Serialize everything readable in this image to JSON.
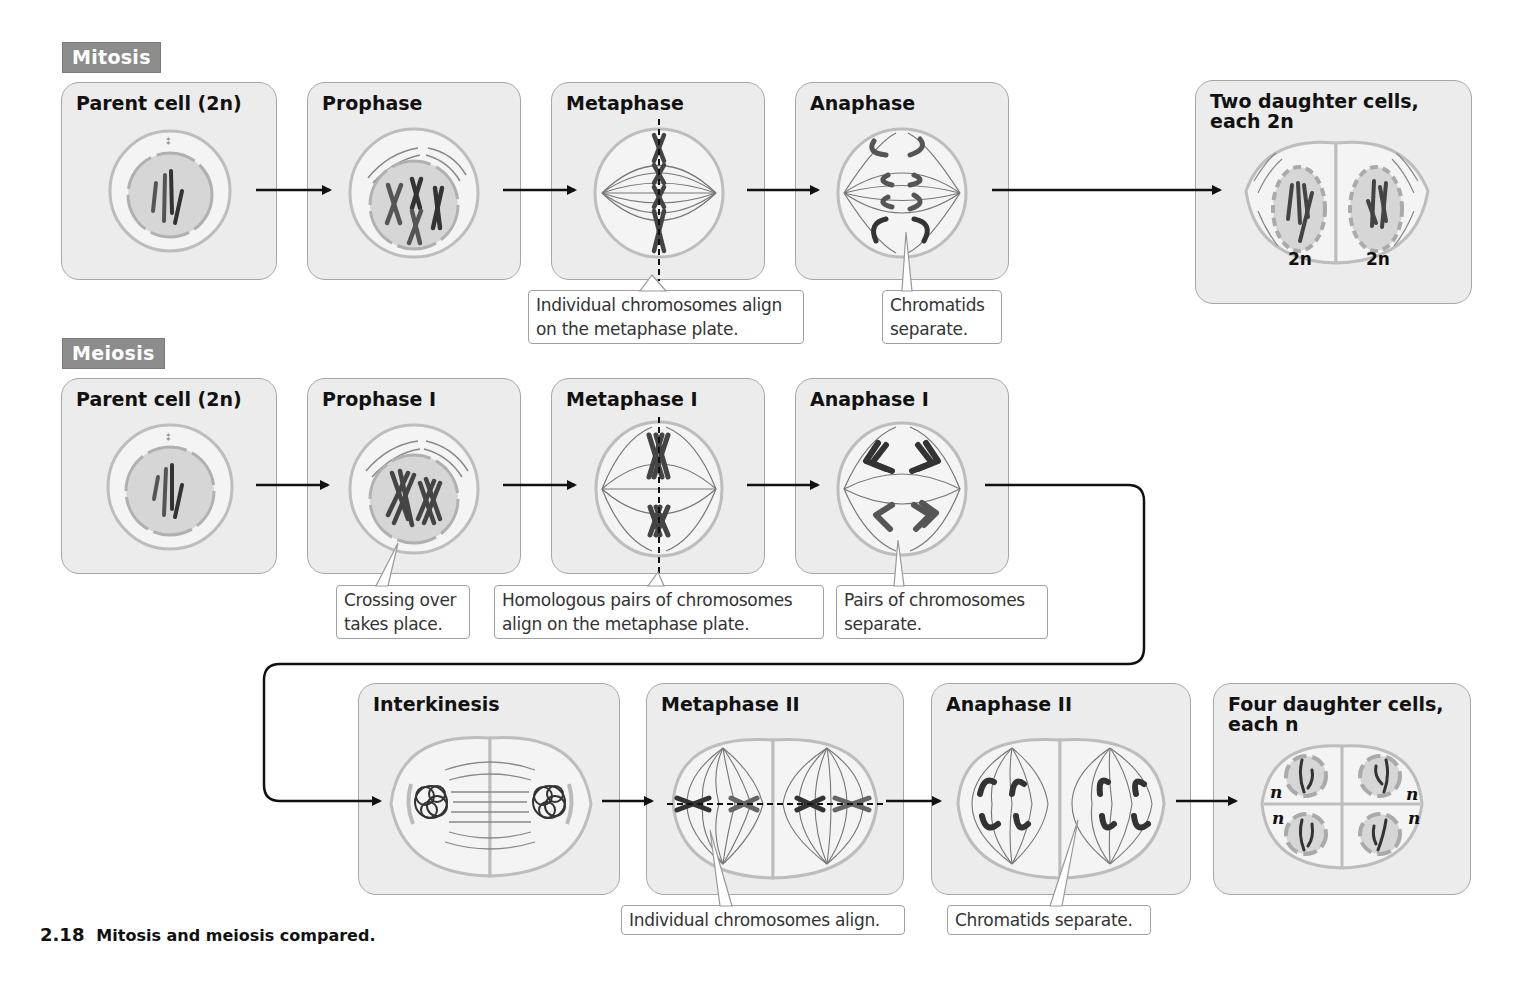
{
  "figure": {
    "number": "2.18",
    "caption": "Mitosis and meiosis compared."
  },
  "mitosis": {
    "label": "Mitosis",
    "stages": [
      {
        "id": "parent",
        "title": "Parent cell (2n)"
      },
      {
        "id": "prophase",
        "title": "Prophase"
      },
      {
        "id": "metaphase",
        "title": "Metaphase"
      },
      {
        "id": "anaphase",
        "title": "Anaphase"
      },
      {
        "id": "daughters",
        "title": "Two daughter cells,\neach 2n"
      }
    ],
    "ploidy_labels": [
      "2n",
      "2n"
    ],
    "callouts": {
      "metaphase": "Individual chromosomes align\non the metaphase plate.",
      "anaphase": "Chromatids\nseparate."
    }
  },
  "meiosis": {
    "label": "Meiosis",
    "stages": [
      {
        "id": "parent",
        "title": "Parent cell (2n)"
      },
      {
        "id": "prophase1",
        "title": "Prophase I"
      },
      {
        "id": "metaphase1",
        "title": "Metaphase I"
      },
      {
        "id": "anaphase1",
        "title": "Anaphase I"
      },
      {
        "id": "interkinesis",
        "title": "Interkinesis"
      },
      {
        "id": "metaphase2",
        "title": "Metaphase II"
      },
      {
        "id": "anaphase2",
        "title": "Anaphase II"
      },
      {
        "id": "daughters",
        "title": "Four daughter cells,\neach n"
      }
    ],
    "ploidy_labels": [
      "n",
      "n",
      "n",
      "n"
    ],
    "callouts": {
      "prophase1": "Crossing over\ntakes place.",
      "metaphase1": "Homologous pairs of chromosomes\nalign on the metaphase plate.",
      "anaphase1": "Pairs of chromosomes\nseparate.",
      "metaphase2": "Individual chromosomes align.",
      "anaphase2": "Chromatids separate."
    }
  },
  "colors": {
    "panel_bg": "#ececec",
    "panel_border": "#a6a6a6",
    "tag_bg": "#8c8c8c",
    "arrow": "#111111",
    "chromosome_dark": "#3a3a3a",
    "chromosome_mid": "#666666",
    "nucleus": "#cfcfcf",
    "membrane": "#b5b5b5"
  }
}
